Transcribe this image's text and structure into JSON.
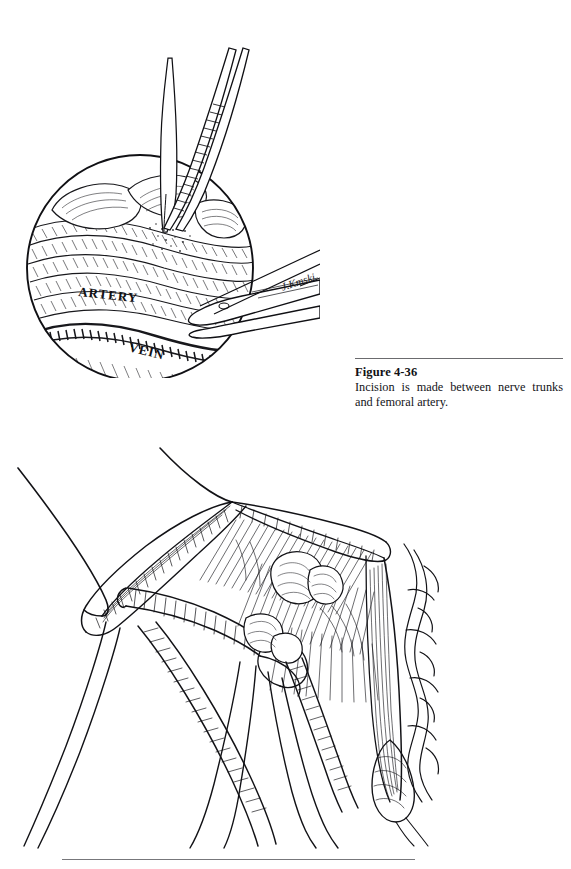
{
  "page": {
    "background_color": "#ffffff",
    "ink_color": "#111114",
    "rule_color": "#6b6b6e",
    "width": 571,
    "height": 869
  },
  "caption": {
    "figure_number": "Figure 4-36",
    "text": "Incision is made between nerve trunks and femoral artery."
  },
  "inset_figure": {
    "name": "circular-inset-illustration",
    "description": "Circular magnified inset: scalpel and forceps making an incision in femoral sheath tissue",
    "labels": {
      "artery": "ARTERY",
      "vein": "VEIN"
    },
    "signature": "J.Kmski",
    "instruments": [
      "scalpel-blade",
      "tissue-forceps"
    ]
  },
  "main_figure": {
    "name": "main-surgical-field-illustration",
    "description": "Exposed femoral triangle with retracted fascia, nerve trunks, femoral artery and vein, held by retractors and traction sutures",
    "elements": [
      "traction-suture-upper",
      "traction-suture-left",
      "retractor-blade-left",
      "retractor-blade-center",
      "retractor-blade-right",
      "femoral-artery",
      "femoral-vein",
      "nerve-trunks",
      "muscle-fascia"
    ]
  },
  "bottom_rule": {
    "present": true
  }
}
